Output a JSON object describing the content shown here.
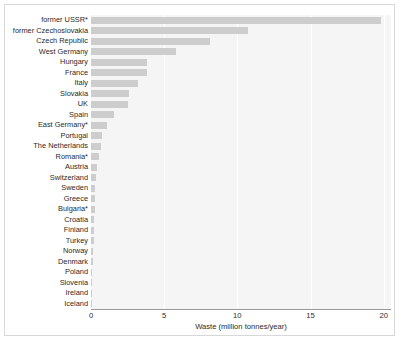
{
  "chart_data": {
    "type": "bar",
    "orientation": "horizontal",
    "title": "",
    "xlabel": "Waste (million tonnes/year)",
    "ylabel": "",
    "xlim": [
      0,
      20.5
    ],
    "xticks": [
      0,
      5,
      10,
      15,
      20
    ],
    "xtick_labels": [
      "0",
      "5",
      "10",
      "15",
      "20"
    ],
    "grid": "vertical",
    "legend": "none",
    "bar_color": "#cdcdcd",
    "plot_background": "#f5f5f5",
    "figure_background": "#ffffff",
    "axis_color": "#9a9a9a",
    "text_color": "#2a2a2a",
    "footnote_marker": "*",
    "categories": [
      "former USSR*",
      "former Czechoslovakia",
      "Czech Republic",
      "West Germany",
      "Hungary",
      "France",
      "Italy",
      "Slovakia",
      "UK",
      "Spain",
      "East Germany*",
      "Portugal",
      "The Netherlands",
      "Romania*",
      "Austria",
      "Switzerland",
      "Sweden",
      "Greece",
      "Bulgaria*",
      "Croatia",
      "Finland",
      "Turkey",
      "Norway",
      "Denmark",
      "Poland",
      "Slovenia",
      "Ireland",
      "Iceland"
    ],
    "values": [
      19.8,
      10.7,
      8.1,
      5.8,
      3.8,
      3.8,
      3.2,
      2.6,
      2.5,
      1.6,
      1.1,
      0.75,
      0.65,
      0.55,
      0.38,
      0.33,
      0.3,
      0.28,
      0.25,
      0.22,
      0.2,
      0.18,
      0.14,
      0.11,
      0.09,
      0.07,
      0.05,
      0.04
    ]
  }
}
